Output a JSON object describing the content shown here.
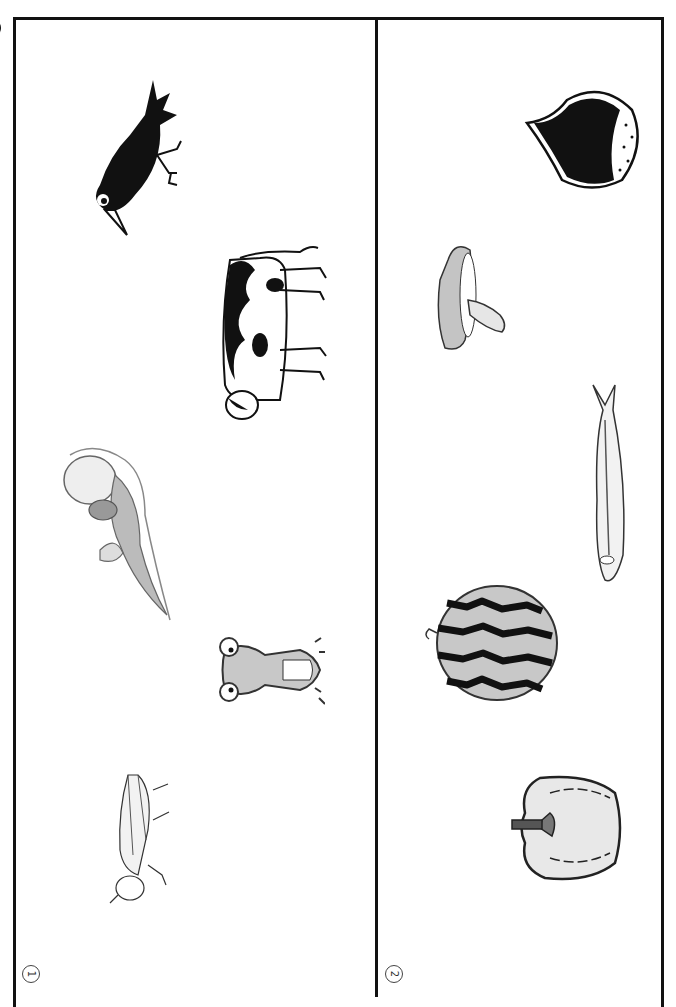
{
  "worksheet": {
    "title_partial": "なかまわけ",
    "orientation": "rotated-90",
    "side_note": "",
    "sections": [
      {
        "number": "1",
        "number_glyph": "①",
        "theme": "animals",
        "items": [
          {
            "name": "crow",
            "icon": "crow-icon"
          },
          {
            "name": "cow",
            "icon": "cow-icon"
          },
          {
            "name": "sea-otter",
            "icon": "sea-otter-icon"
          },
          {
            "name": "frog",
            "icon": "frog-icon"
          },
          {
            "name": "grasshopper",
            "icon": "grasshopper-icon"
          }
        ]
      },
      {
        "number": "2",
        "number_glyph": "②",
        "theme": "foods",
        "items": [
          {
            "name": "chestnut",
            "icon": "chestnut-icon"
          },
          {
            "name": "mushroom",
            "icon": "mushroom-icon"
          },
          {
            "name": "saury-fish",
            "icon": "fish-icon"
          },
          {
            "name": "watermelon",
            "icon": "watermelon-icon"
          },
          {
            "name": "bell-pepper",
            "icon": "pepper-icon"
          }
        ]
      }
    ],
    "colors": {
      "line": "#111111",
      "gray_fill": "#c8c8c8",
      "light_fill": "#e6e6e6"
    }
  }
}
